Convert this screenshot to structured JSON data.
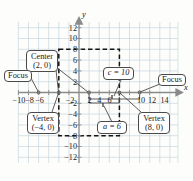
{
  "figure": {
    "type": "coordinate-graph",
    "axis": {
      "x_label": "x",
      "y_label": "y",
      "x_ticks": [
        -10,
        -8,
        -6,
        -4,
        -2,
        2,
        4,
        6,
        8,
        10,
        12,
        14
      ],
      "x_tick_labels": [
        "-10",
        "-8",
        "-6",
        "-4",
        "-2",
        "2",
        "4",
        "6",
        "8",
        "10",
        "12",
        "14"
      ],
      "x_visible_tick_labels": [
        "-10",
        "-8",
        "-6",
        "-2",
        "2",
        "4",
        "6",
        "10",
        "12",
        "14"
      ],
      "y_ticks": [
        12,
        10,
        8,
        6,
        4,
        2,
        -2,
        -4,
        -6,
        -8,
        -10,
        -12
      ],
      "y_tick_labels": [
        "12",
        "10",
        "8",
        "6",
        "4",
        "2",
        "-2",
        "-4",
        "-6",
        "-8",
        "-10",
        "-12"
      ],
      "xlim": [
        -12,
        15
      ],
      "ylim": [
        -13,
        13
      ],
      "grid": true,
      "grid_step": 2
    },
    "bounding_box": {
      "x_min": -4,
      "x_max": 8,
      "y_min": -8,
      "y_max": 8,
      "style": "dashed"
    },
    "points": [
      {
        "name": "center",
        "x": 2,
        "y": 0
      },
      {
        "name": "vertex-left",
        "x": -4,
        "y": 0
      },
      {
        "name": "vertex-right",
        "x": 8,
        "y": 0
      },
      {
        "name": "focus-left",
        "x": -8,
        "y": 0
      },
      {
        "name": "focus-right",
        "x": 12,
        "y": 0
      }
    ],
    "colors": {
      "grid": "#c9d6df",
      "axis": "#777777",
      "dashed": "#1a1a1a",
      "callout_border": "#4a4a4a",
      "callout_fill": "#ffffff",
      "text": "#1a1a1a",
      "background": "#fdfdfb"
    }
  },
  "callouts": {
    "center": {
      "line1": "Center",
      "line2": "(2, 0)"
    },
    "focus_left": {
      "line1": "Focus"
    },
    "focus_right": {
      "line1": "Focus"
    },
    "vertex_left": {
      "line1": "Vertex",
      "line2": "(−4, 0)"
    },
    "vertex_right": {
      "line1": "Vertex",
      "line2": "(8, 0)"
    },
    "c_value": {
      "line1": "c = 10"
    },
    "a_value": {
      "line1": "a = 6"
    }
  }
}
